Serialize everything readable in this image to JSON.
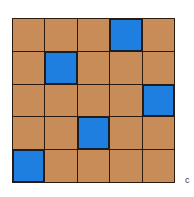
{
  "grid": {
    "rows": 5,
    "cols": 5,
    "colors": {
      "base": "#c88c58",
      "highlight": "#1f7fe0",
      "line": "#2a1a10"
    },
    "cells": [
      [
        0,
        0,
        0,
        1,
        0
      ],
      [
        0,
        1,
        0,
        0,
        0
      ],
      [
        0,
        0,
        0,
        0,
        1
      ],
      [
        0,
        0,
        1,
        0,
        0
      ],
      [
        1,
        0,
        0,
        0,
        0
      ]
    ]
  },
  "label": "c"
}
